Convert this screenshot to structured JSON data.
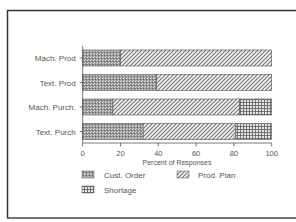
{
  "chart_data": {
    "type": "bar",
    "orientation": "horizontal",
    "stacked": true,
    "title": "",
    "xlabel": "Percent of Responses",
    "ylabel": "",
    "xlim": [
      0,
      100
    ],
    "x_ticks": [
      0,
      20,
      40,
      60,
      80,
      100
    ],
    "x_tick_labels": [
      "0",
      "20",
      "40",
      "60",
      "80",
      "100"
    ],
    "categories": [
      "Mach. Prod",
      "Text. Prod",
      "Mach. Purch.",
      "Text. Purch"
    ],
    "series": [
      {
        "name": "Cust. Order",
        "pattern": "dense-crosshatch",
        "values": [
          20,
          39,
          16,
          32
        ]
      },
      {
        "name": "Prod. Plan",
        "pattern": "diagonal-hatch",
        "values": [
          80,
          61,
          67,
          49
        ]
      },
      {
        "name": "Shortage",
        "pattern": "grid-hatch",
        "values": [
          0,
          0,
          17,
          19
        ]
      }
    ],
    "legend": {
      "position": "bottom",
      "entries": [
        "Cust. Order",
        "Prod. Plan",
        "Shortage"
      ]
    },
    "grid": false
  }
}
